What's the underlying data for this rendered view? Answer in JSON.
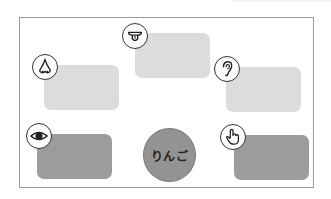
{
  "center": {
    "label": "りんご",
    "color": "#939393"
  },
  "senses": [
    {
      "name": "taste",
      "icon": "tongue-icon",
      "shade": "light",
      "color": "#dcdcdc"
    },
    {
      "name": "smell",
      "icon": "nose-icon",
      "shade": "light",
      "color": "#dcdcdc"
    },
    {
      "name": "hearing",
      "icon": "ear-icon",
      "shade": "light",
      "color": "#dcdcdc"
    },
    {
      "name": "sight",
      "icon": "eye-icon",
      "shade": "dark",
      "color": "#9c9c9c"
    },
    {
      "name": "touch",
      "icon": "hand-pointer-icon",
      "shade": "dark",
      "color": "#9c9c9c"
    }
  ]
}
